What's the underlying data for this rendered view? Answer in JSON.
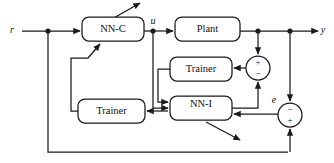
{
  "diagram": {
    "blocks": [
      {
        "id": "nn-c",
        "label": "NN-C",
        "x": 82,
        "y": 17,
        "w": 62,
        "h": 24
      },
      {
        "id": "plant",
        "label": "Plant",
        "x": 175,
        "y": 17,
        "w": 65,
        "h": 24
      },
      {
        "id": "trainer-1",
        "label": "Trainer",
        "x": 170,
        "y": 57,
        "w": 62,
        "h": 24
      },
      {
        "id": "nn-i",
        "label": "NN-I",
        "x": 170,
        "y": 96,
        "w": 62,
        "h": 24
      },
      {
        "id": "trainer-2",
        "label": "Trainer",
        "x": 78,
        "y": 99,
        "w": 67,
        "h": 24
      }
    ],
    "signals": [
      {
        "id": "r",
        "label": "r",
        "x": 12,
        "y": 31
      },
      {
        "id": "u",
        "label": "u",
        "x": 153,
        "y": 22
      },
      {
        "id": "y",
        "label": "y",
        "x": 323,
        "y": 31
      },
      {
        "id": "e",
        "label": "e",
        "x": 274,
        "y": 101
      }
    ],
    "summing_junctions": [
      {
        "id": "sum-upper",
        "cx": 258,
        "cy": 68,
        "r": 12,
        "signs": [
          {
            "symbol": "+",
            "dx": 0,
            "dy": -5
          },
          {
            "symbol": "−",
            "dx": 0,
            "dy": 5
          }
        ]
      },
      {
        "id": "sum-lower",
        "cx": 290,
        "cy": 115,
        "r": 12,
        "signs": [
          {
            "symbol": "−",
            "dx": 0,
            "dy": -5
          },
          {
            "symbol": "+",
            "dx": 0,
            "dy": 5
          }
        ]
      }
    ],
    "nodes": [
      {
        "id": "node-r",
        "cx": 48,
        "cy": 31
      },
      {
        "id": "node-u",
        "cx": 153,
        "cy": 31
      },
      {
        "id": "node-plant",
        "cx": 258,
        "cy": 31
      },
      {
        "id": "node-y",
        "cx": 290,
        "cy": 31
      }
    ],
    "colors": {
      "stroke": "#1a1a1a",
      "background": "#ffffff",
      "text": "#111111"
    }
  }
}
